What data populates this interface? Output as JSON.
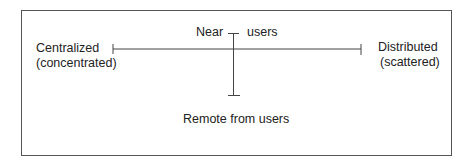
{
  "diagram": {
    "axes": {
      "horizontal": {
        "left_label_line1": "Centralized",
        "left_label_line2": "(concentrated)",
        "right_label_line1": "Distributed",
        "right_label_line2": "(scattered)"
      },
      "vertical": {
        "top_label_left": "Near",
        "top_label_right": "users",
        "bottom_label": "Remote from users"
      }
    },
    "colors": {
      "line": "#444444",
      "text": "#222222",
      "border": "#555555"
    }
  }
}
